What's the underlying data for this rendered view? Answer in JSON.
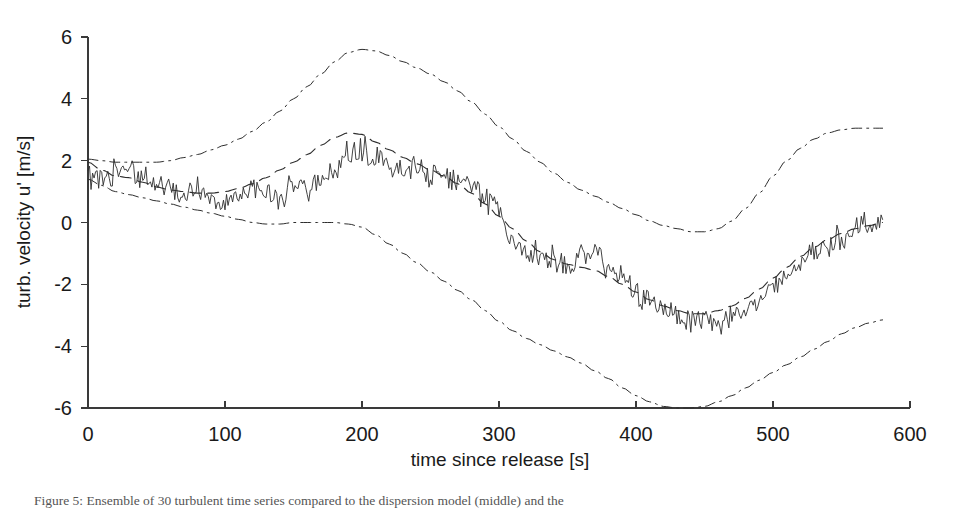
{
  "figure": {
    "caption": "Figure 5: Ensemble of 30 turbulent time series compared to the dispersion model (middle) and the",
    "background_color": "#ffffff",
    "ink_color": "#2e2e2e"
  },
  "chart_data": {
    "type": "line",
    "title": "",
    "xlabel": "time since release [s]",
    "ylabel": "turb. velocity u' [m/s]",
    "xlim": [
      0,
      600
    ],
    "ylim": [
      -6,
      6
    ],
    "xticks": [
      0,
      100,
      200,
      300,
      400,
      500,
      600
    ],
    "yticks": [
      -6,
      -4,
      -2,
      0,
      2,
      4,
      6
    ],
    "grid": false,
    "legend_position": "none",
    "x_sample_step": 10,
    "x": [
      0,
      10,
      20,
      30,
      40,
      50,
      60,
      70,
      80,
      90,
      100,
      110,
      120,
      130,
      140,
      150,
      160,
      170,
      180,
      190,
      200,
      210,
      220,
      230,
      240,
      250,
      260,
      270,
      280,
      290,
      300,
      310,
      320,
      330,
      340,
      350,
      360,
      370,
      380,
      390,
      400,
      410,
      420,
      430,
      440,
      450,
      460,
      470,
      480,
      490,
      500,
      510,
      520,
      530,
      540,
      550,
      560,
      570,
      580
    ],
    "series": [
      {
        "name": "measured turbulent velocity",
        "style": "solid",
        "noise_amplitude": 0.32,
        "values": [
          1.45,
          1.55,
          1.6,
          1.75,
          1.5,
          1.3,
          1.05,
          0.95,
          1.15,
          0.85,
          0.75,
          0.9,
          1.1,
          0.85,
          0.8,
          1.25,
          1.0,
          1.35,
          1.6,
          2.2,
          2.4,
          2.05,
          1.9,
          1.8,
          1.7,
          1.55,
          1.5,
          1.35,
          1.1,
          0.75,
          0.4,
          -0.6,
          -1.0,
          -0.95,
          -1.2,
          -1.35,
          -1.15,
          -1.0,
          -1.4,
          -1.85,
          -2.3,
          -2.55,
          -2.7,
          -3.0,
          -3.1,
          -3.05,
          -3.35,
          -2.9,
          -2.85,
          -2.55,
          -2.2,
          -1.7,
          -1.35,
          -0.95,
          -0.7,
          -0.45,
          -0.2,
          0.0,
          0.1
        ]
      },
      {
        "name": "dispersion model (mean)",
        "style": "dashed",
        "noise_amplitude": 0.0,
        "values": [
          1.95,
          1.7,
          1.5,
          1.45,
          1.3,
          1.15,
          1.05,
          1.0,
          0.95,
          0.95,
          1.0,
          1.1,
          1.25,
          1.45,
          1.7,
          1.95,
          2.2,
          2.5,
          2.75,
          2.9,
          2.85,
          2.6,
          2.35,
          2.1,
          1.9,
          1.7,
          1.5,
          1.25,
          0.95,
          0.6,
          0.2,
          -0.2,
          -0.6,
          -0.95,
          -1.2,
          -1.35,
          -1.45,
          -1.55,
          -1.75,
          -2.0,
          -2.25,
          -2.5,
          -2.7,
          -2.85,
          -2.95,
          -2.95,
          -2.85,
          -2.7,
          -2.45,
          -2.15,
          -1.8,
          -1.45,
          -1.1,
          -0.8,
          -0.55,
          -0.35,
          -0.2,
          -0.1,
          0.0
        ]
      },
      {
        "name": "upper envelope",
        "style": "dashdot",
        "noise_amplitude": 0.0,
        "values": [
          2.05,
          2.0,
          1.95,
          1.95,
          1.95,
          1.95,
          2.0,
          2.1,
          2.2,
          2.35,
          2.5,
          2.7,
          2.95,
          3.25,
          3.6,
          4.0,
          4.4,
          4.8,
          5.2,
          5.5,
          5.6,
          5.55,
          5.4,
          5.2,
          5.0,
          4.8,
          4.55,
          4.25,
          3.9,
          3.5,
          3.1,
          2.7,
          2.3,
          1.95,
          1.6,
          1.3,
          1.05,
          0.85,
          0.65,
          0.45,
          0.25,
          0.05,
          -0.1,
          -0.2,
          -0.3,
          -0.3,
          -0.2,
          0.05,
          0.45,
          0.95,
          1.5,
          2.0,
          2.4,
          2.7,
          2.9,
          3.0,
          3.05,
          3.05,
          3.05
        ]
      },
      {
        "name": "lower envelope",
        "style": "dashdot",
        "noise_amplitude": 0.0,
        "values": [
          1.4,
          1.2,
          1.0,
          0.9,
          0.8,
          0.7,
          0.6,
          0.5,
          0.4,
          0.3,
          0.2,
          0.1,
          0.0,
          -0.05,
          -0.05,
          0.0,
          0.0,
          0.0,
          0.0,
          -0.05,
          -0.15,
          -0.4,
          -0.7,
          -1.0,
          -1.3,
          -1.6,
          -1.9,
          -2.2,
          -2.5,
          -2.85,
          -3.2,
          -3.5,
          -3.75,
          -3.95,
          -4.15,
          -4.35,
          -4.55,
          -4.8,
          -5.05,
          -5.35,
          -5.6,
          -5.8,
          -5.95,
          -6.0,
          -6.0,
          -5.95,
          -5.8,
          -5.6,
          -5.35,
          -5.1,
          -4.85,
          -4.6,
          -4.35,
          -4.1,
          -3.85,
          -3.6,
          -3.4,
          -3.25,
          -3.15
        ]
      }
    ]
  }
}
